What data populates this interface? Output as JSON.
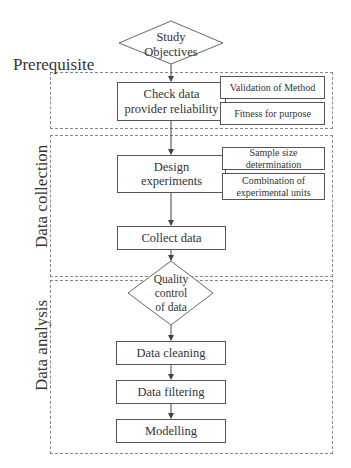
{
  "sections": {
    "prerequisite": "Prerequisite",
    "data_collection": "Data collection",
    "data_analysis": "Data analysis"
  },
  "nodes": {
    "study_objectives": {
      "line1": "Study",
      "line2": "Objectives"
    },
    "check_data": {
      "line1": "Check data",
      "line2": "provider reliability"
    },
    "validation": "Validation of Method",
    "fitness": "Fitness for purpose",
    "design": {
      "line1": "Design",
      "line2": "experiments"
    },
    "sample_size": {
      "line1": "Sample size",
      "line2": "determination"
    },
    "combination": {
      "line1": "Combination of",
      "line2": "experimental units"
    },
    "collect": "Collect data",
    "quality": {
      "line1": "Quality",
      "line2": "control",
      "line3": "of data"
    },
    "cleaning": "Data cleaning",
    "filtering": "Data filtering",
    "modelling": "Modelling"
  }
}
